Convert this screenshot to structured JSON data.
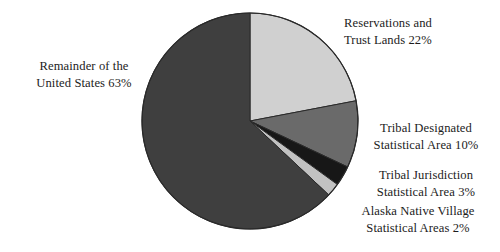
{
  "chart_data": {
    "type": "pie",
    "title": "",
    "subtitle": "",
    "xlabel": "",
    "ylabel": "",
    "legend_position": "callout-labels",
    "grid": false,
    "start_angle_deg": 0,
    "direction": "clockwise",
    "units": "percent",
    "categories": [
      "Reservations and Trust Lands",
      "Tribal Designated Statistical Area",
      "Tribal Jurisdiction Statistical Area",
      "Alaska Native Village Statistical Areas",
      "Remainder of the United States"
    ],
    "values": [
      22,
      10,
      3,
      2,
      63
    ],
    "colors": [
      "#d0d0d0",
      "#6a6a6a",
      "#171717",
      "#c2c2c2",
      "#3f3f3f"
    ],
    "slices": [
      {
        "name": "reservations-and-trust-lands",
        "label_line1": "Reservations and",
        "label_line2": "Trust Lands 22%",
        "value": 22,
        "color": "#d0d0d0"
      },
      {
        "name": "tribal-designated-statistical-area",
        "label_line1": "Tribal Designated",
        "label_line2": "Statistical Area 10%",
        "value": 10,
        "color": "#6a6a6a"
      },
      {
        "name": "tribal-jurisdiction-statistical-area",
        "label_line1": "Tribal Jurisdiction",
        "label_line2": "Statistical Area 3%",
        "value": 3,
        "color": "#171717"
      },
      {
        "name": "alaska-native-village-statistical-areas",
        "label_line1": "Alaska Native Village",
        "label_line2": "Statistical Areas 2%",
        "value": 2,
        "color": "#c2c2c2"
      },
      {
        "name": "remainder-of-the-united-states",
        "label_line1": "Remainder of the",
        "label_line2": "United States 63%",
        "value": 63,
        "color": "#3f3f3f"
      }
    ]
  },
  "geometry": {
    "center_x": 250,
    "center_y": 121,
    "radius": 108,
    "stroke": "#2a2a2a",
    "background": "#ffffff"
  }
}
